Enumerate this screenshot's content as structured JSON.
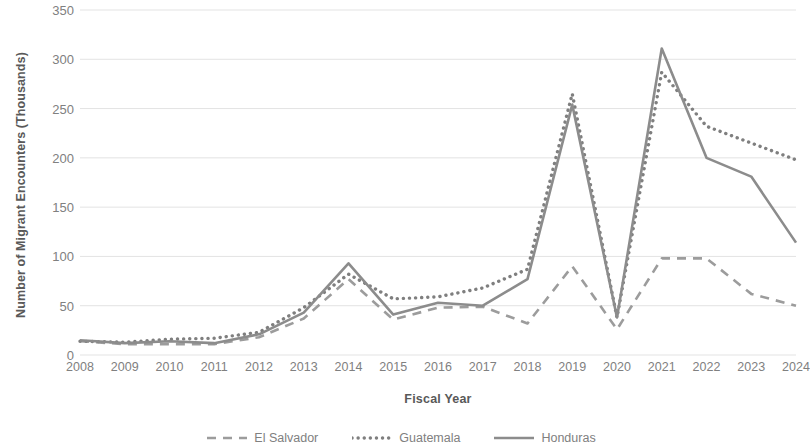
{
  "chart_data": {
    "type": "line",
    "title": "",
    "xlabel": "Fiscal Year",
    "ylabel": "Number of Migrant Encounters (Thousands)",
    "categories": [
      "2008",
      "2009",
      "2010",
      "2011",
      "2012",
      "2013",
      "2014",
      "2015",
      "2016",
      "2017",
      "2018",
      "2019",
      "2020",
      "2021",
      "2022",
      "2023",
      "2024"
    ],
    "x": [
      2008,
      2009,
      2010,
      2011,
      2012,
      2013,
      2014,
      2015,
      2016,
      2017,
      2018,
      2019,
      2020,
      2021,
      2022,
      2023,
      2024
    ],
    "ylim": [
      0,
      350
    ],
    "yticks": [
      0,
      50,
      100,
      150,
      200,
      250,
      300,
      350
    ],
    "grid": true,
    "legend_position": "bottom",
    "series": [
      {
        "name": "El Salvador",
        "style": "dashed",
        "color": "#9c9c9c",
        "values": [
          14,
          11,
          11,
          11,
          18,
          37,
          77,
          36,
          48,
          49,
          32,
          90,
          26,
          98,
          98,
          62,
          50
        ]
      },
      {
        "name": "Guatemala",
        "style": "dotted",
        "color": "#7f7f7f",
        "values": [
          14,
          13,
          16,
          17,
          23,
          48,
          82,
          57,
          59,
          68,
          87,
          265,
          38,
          287,
          232,
          215,
          198
        ]
      },
      {
        "name": "Honduras",
        "style": "solid",
        "color": "#8c8c8c",
        "values": [
          15,
          12,
          14,
          12,
          21,
          43,
          93,
          41,
          53,
          50,
          77,
          254,
          38,
          311,
          200,
          181,
          114
        ]
      }
    ]
  },
  "axis": {
    "y_title": "Number of Migrant Encounters (Thousands)",
    "x_title": "Fiscal Year",
    "y_tick_labels": [
      "0",
      "50",
      "100",
      "150",
      "200",
      "250",
      "300",
      "350"
    ],
    "x_tick_labels": [
      "2008",
      "2009",
      "2010",
      "2011",
      "2012",
      "2013",
      "2014",
      "2015",
      "2016",
      "2017",
      "2018",
      "2019",
      "2020",
      "2021",
      "2022",
      "2023",
      "2024"
    ]
  },
  "legend": {
    "items": [
      {
        "label": "El Salvador",
        "style": "dashed"
      },
      {
        "label": "Guatemala",
        "style": "dotted"
      },
      {
        "label": "Honduras",
        "style": "solid"
      }
    ]
  },
  "colors": {
    "grid": "#e3e3e3",
    "text": "#808080",
    "title_text": "#595959",
    "el_salvador": "#9c9c9c",
    "guatemala": "#7f7f7f",
    "honduras": "#8c8c8c"
  }
}
